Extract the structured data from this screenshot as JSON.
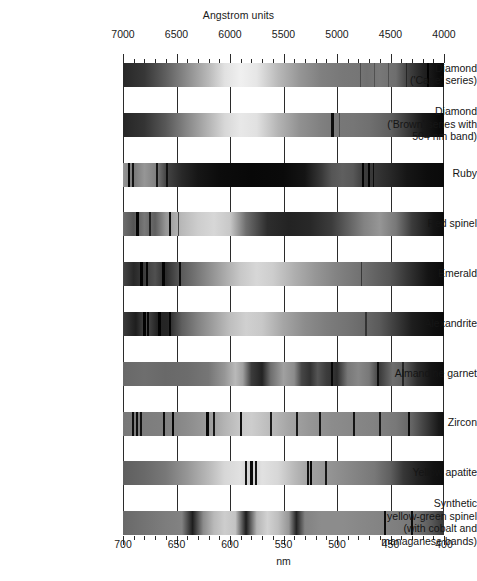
{
  "axes": {
    "top_title": "Angstrom units",
    "bottom_title": "nm",
    "top_ticks": [
      "7000",
      "6500",
      "6000",
      "5500",
      "5000",
      "4500",
      "4000"
    ],
    "bottom_ticks": [
      "700",
      "650",
      "600",
      "550",
      "500",
      "450",
      "400"
    ],
    "x_min_angstrom": 4000,
    "x_max_angstrom": 7000,
    "direction": "descending-left-to-right",
    "minor_tick_step_angstrom": 100,
    "major_tick_step_angstrom": 500
  },
  "rows": [
    {
      "label_lines": [
        "Diamond",
        "('Cape' series)"
      ],
      "name": "diamond-cape-series"
    },
    {
      "label_lines": [
        "Diamond",
        "('Brown' series with",
        "504 nm band)"
      ],
      "name": "diamond-brown-series"
    },
    {
      "label_lines": [
        "Ruby"
      ],
      "name": "ruby"
    },
    {
      "label_lines": [
        "Red spinel"
      ],
      "name": "red-spinel"
    },
    {
      "label_lines": [
        "Emerald"
      ],
      "name": "emerald"
    },
    {
      "label_lines": [
        "Alexandrite"
      ],
      "name": "alexandrite"
    },
    {
      "label_lines": [
        "Almandine garnet"
      ],
      "name": "almandine-garnet"
    },
    {
      "label_lines": [
        "Zircon"
      ],
      "name": "zircon"
    },
    {
      "label_lines": [
        "Yellow apatite"
      ],
      "name": "yellow-apatite"
    },
    {
      "label_lines": [
        "Synthetic",
        "yellow-green spinel",
        "(with cobalt and",
        "managanese bands)"
      ],
      "name": "synthetic-yellow-green-spinel"
    }
  ],
  "chart_data": {
    "type": "heatmap",
    "xlabel": "Angstrom units",
    "xlabel_secondary": "nm",
    "xlim": [
      7000,
      4000
    ],
    "x_ticks": [
      7000,
      6500,
      6000,
      5500,
      5000,
      4500,
      4000
    ],
    "x_ticks_nm": [
      700,
      650,
      600,
      550,
      500,
      450,
      400
    ],
    "grid": true,
    "legend": "none",
    "ylabel": "",
    "categories": [
      "Diamond ('Cape' series)",
      "Diamond ('Brown' series with 504 nm band)",
      "Ruby",
      "Red spinel",
      "Emerald",
      "Alexandrite",
      "Almandine garnet",
      "Zircon",
      "Yellow apatite",
      "Synthetic yellow-green spinel (with cobalt and managanese bands)"
    ],
    "series": [
      {
        "name": "Diamond ('Cape' series)",
        "continuum": "bright band centred near 5800-6000 A, darkening toward both ends, strongly dark below 4200 A",
        "absorption_lines_angstrom": [
          4780,
          4650,
          4520,
          4350,
          4150
        ],
        "strong_lines_angstrom": [
          4150
        ],
        "cutoff_angstrom": 4100
      },
      {
        "name": "Diamond ('Brown' series with 504 nm band)",
        "continuum": "bright near 5800 A, gradual darkening to violet",
        "absorption_lines_angstrom": [
          5040,
          4980
        ],
        "strong_lines_angstrom": [
          5040
        ],
        "cutoff_angstrom": 4150
      },
      {
        "name": "Ruby",
        "continuum": "narrow red transmission window above 6700 A, broad dark absorption 5200-6100 A, green transmission near 5000 A",
        "absorption_lines_angstrom": [
          6942,
          6928,
          6680,
          6590,
          4760,
          4750,
          4685,
          4680
        ],
        "strong_lines_angstrom": [
          6942,
          6928,
          4760,
          4685
        ],
        "broad_bands_angstrom": [
          [
            5200,
            6100
          ],
          [
            4000,
            4400
          ]
        ],
        "cutoff_angstrom": 4200
      },
      {
        "name": "Red spinel",
        "continuum": "red transmission above 6600 A, broad dark band through the green-yellow",
        "absorption_lines_angstrom": [
          6860,
          6750,
          6560,
          6500
        ],
        "strong_lines_angstrom": [
          6860,
          6560
        ],
        "broad_bands_angstrom": [
          [
            5000,
            6000
          ]
        ],
        "cutoff_angstrom": 4300
      },
      {
        "name": "Emerald",
        "continuum": "bright near 5600-5900 A with steady darkening to the violet",
        "absorption_lines_angstrom": [
          6830,
          6800,
          6620,
          6460,
          4770
        ],
        "strong_lines_angstrom": [
          6830,
          6800,
          6620
        ],
        "broad_bands_angstrom": [
          [
            5800,
            6300
          ]
        ],
        "cutoff_angstrom": 4250
      },
      {
        "name": "Alexandrite",
        "continuum": "bright yellow-green region near 5700 A, dark toward the violet",
        "absorption_lines_angstrom": [
          6800,
          6780,
          6650,
          6550,
          4730
        ],
        "strong_lines_angstrom": [
          6800,
          6650,
          6550
        ],
        "broad_bands_angstrom": [
          [
            5700,
            6100
          ]
        ],
        "cutoff_angstrom": 4300
      },
      {
        "name": "Almandine garnet",
        "continuum": "broad iron bands dominating the yellow-green region",
        "absorption_lines_angstrom": [
          5050,
          4620,
          4380
        ],
        "strong_lines_angstrom": [
          5760,
          5270,
          5050
        ],
        "broad_bands_angstrom": [
          [
            5650,
            5880
          ],
          [
            5150,
            5380
          ],
          [
            4950,
            5120
          ]
        ],
        "cutoff_angstrom": 4200
      },
      {
        "name": "Zircon",
        "continuum": "near-uniform brightness crossed by many narrow uranium lines",
        "absorption_lines_angstrom": [
          6910,
          6840,
          6620,
          6535,
          6210,
          6150,
          5895,
          5620,
          5375,
          5160,
          4840,
          4600,
          4327
        ],
        "strong_lines_angstrom": [
          6535,
          6210,
          5895,
          4327
        ],
        "cutoff_angstrom": 4100
      },
      {
        "name": "Yellow apatite",
        "continuum": "bright yellow region, sharp didymium line groups",
        "absorption_lines_angstrom": [
          5850,
          5800,
          5770,
          5270,
          5250,
          5100
        ],
        "strong_lines_angstrom": [
          5800,
          5770,
          5270,
          5250
        ],
        "broad_bands_angstrom": [
          [
            4200,
            4500
          ]
        ],
        "cutoff_angstrom": 4150
      },
      {
        "name": "Synthetic yellow-green spinel (with cobalt and managanese bands)",
        "continuum": "bright yellow-orange with three strong broad cobalt/manganese bands",
        "absorption_lines_angstrom": [
          4550,
          4300
        ],
        "strong_lines_angstrom": [
          6350,
          5850,
          5400
        ],
        "broad_bands_angstrom": [
          [
            6250,
            6450
          ],
          [
            5750,
            5950
          ],
          [
            5340,
            5460
          ]
        ],
        "cutoff_angstrom": 4050
      }
    ]
  }
}
